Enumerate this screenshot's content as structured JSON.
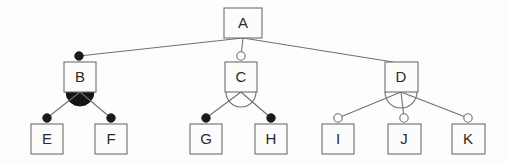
{
  "diagram": {
    "type": "feature-model-tree",
    "canvas": {
      "width": 507,
      "height": 163,
      "background": "#fdfdfd"
    },
    "colors": {
      "box_stroke": "#6e6e6e",
      "box_fill": "#fcfcfc",
      "edge": "#707070",
      "label": "#2a2a2a",
      "filled_decorator": "#1a1a1a",
      "hollow_decorator": "#fdfdfd"
    },
    "levels": [
      {
        "level": 0,
        "labels": [
          "A"
        ]
      },
      {
        "level": 1,
        "labels": [
          "B",
          "C",
          "D"
        ]
      },
      {
        "level": 2,
        "labels": [
          "E",
          "F",
          "G",
          "H",
          "I",
          "J",
          "K"
        ]
      }
    ],
    "nodes": [
      {
        "id": "A",
        "label": "A",
        "x": 224,
        "y": 8,
        "w": 38,
        "h": 30,
        "decorator": "none",
        "level": 0
      },
      {
        "id": "B",
        "label": "B",
        "x": 64,
        "y": 62,
        "w": 32,
        "h": 30,
        "decorator": "filled-circle",
        "level": 1
      },
      {
        "id": "C",
        "label": "C",
        "x": 225,
        "y": 62,
        "w": 32,
        "h": 30,
        "decorator": "hollow-circle",
        "level": 1
      },
      {
        "id": "D",
        "label": "D",
        "x": 385,
        "y": 62,
        "w": 33,
        "h": 30,
        "decorator": "none",
        "level": 1
      },
      {
        "id": "E",
        "label": "E",
        "x": 31,
        "y": 124,
        "w": 32,
        "h": 30,
        "decorator": "filled-circle",
        "level": 2
      },
      {
        "id": "F",
        "label": "F",
        "x": 95,
        "y": 124,
        "w": 32,
        "h": 30,
        "decorator": "filled-circle",
        "level": 2
      },
      {
        "id": "G",
        "label": "G",
        "x": 190,
        "y": 124,
        "w": 32,
        "h": 30,
        "decorator": "filled-circle",
        "level": 2
      },
      {
        "id": "H",
        "label": "H",
        "x": 255,
        "y": 124,
        "w": 32,
        "h": 30,
        "decorator": "filled-circle",
        "level": 2
      },
      {
        "id": "I",
        "label": "I",
        "x": 322,
        "y": 124,
        "w": 32,
        "h": 30,
        "decorator": "hollow-circle",
        "level": 2
      },
      {
        "id": "J",
        "label": "J",
        "x": 388,
        "y": 124,
        "w": 33,
        "h": 30,
        "decorator": "hollow-circle",
        "level": 2
      },
      {
        "id": "K",
        "label": "K",
        "x": 452,
        "y": 124,
        "w": 33,
        "h": 30,
        "decorator": "hollow-circle",
        "level": 2
      }
    ],
    "edges": [
      {
        "from": "A",
        "to": "B",
        "x1": 243,
        "y1": 38,
        "x2": 79,
        "y2": 56
      },
      {
        "from": "A",
        "to": "C",
        "x1": 243,
        "y1": 38,
        "x2": 241,
        "y2": 56
      },
      {
        "from": "A",
        "to": "D",
        "x1": 243,
        "y1": 38,
        "x2": 392,
        "y2": 62
      },
      {
        "from": "B",
        "to": "E",
        "x1": 80,
        "y1": 92,
        "x2": 47,
        "y2": 118
      },
      {
        "from": "B",
        "to": "F",
        "x1": 80,
        "y1": 92,
        "x2": 111,
        "y2": 118
      },
      {
        "from": "C",
        "to": "G",
        "x1": 241,
        "y1": 92,
        "x2": 206,
        "y2": 118
      },
      {
        "from": "C",
        "to": "H",
        "x1": 241,
        "y1": 92,
        "x2": 271,
        "y2": 118
      },
      {
        "from": "D",
        "to": "I",
        "x1": 401,
        "y1": 92,
        "x2": 338,
        "y2": 118
      },
      {
        "from": "D",
        "to": "J",
        "x1": 401,
        "y1": 92,
        "x2": 404,
        "y2": 118
      },
      {
        "from": "D",
        "to": "K",
        "x1": 401,
        "y1": 92,
        "x2": 468,
        "y2": 118
      }
    ],
    "group_arcs": [
      {
        "parent": "B",
        "style": "filled",
        "cx": 80,
        "cy": 92,
        "r": 14
      },
      {
        "parent": "C",
        "style": "hollow",
        "cx": 241,
        "cy": 92,
        "r": 15
      },
      {
        "parent": "D",
        "style": "hollow",
        "cx": 401,
        "cy": 92,
        "r": 16
      }
    ]
  }
}
